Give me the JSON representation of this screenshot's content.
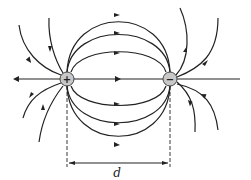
{
  "diagram": {
    "positive_charge": {
      "symbol": "+",
      "cx": 67,
      "cy": 79,
      "r": 7
    },
    "negative_charge": {
      "symbol": "−",
      "cx": 170,
      "cy": 79,
      "r": 7
    },
    "distance_label": "d",
    "colors": {
      "line": "#222222",
      "charge_fill": "#c8c8c8",
      "background": "#ffffff"
    }
  }
}
